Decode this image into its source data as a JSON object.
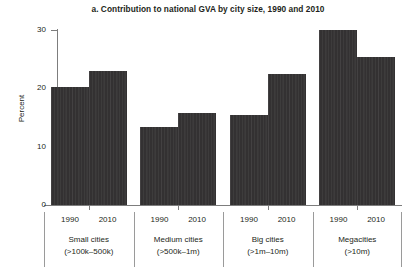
{
  "chart_data": {
    "type": "bar",
    "title": "a. Contribution to national GVA by city size, 1990 and 2010",
    "xlabel": "",
    "ylabel": "Percent",
    "ylim": [
      0,
      30
    ],
    "yticks": [
      0,
      10,
      20,
      30
    ],
    "ytick_labels": [
      "0",
      "10",
      "20",
      "30"
    ],
    "grid": false,
    "legend": "none",
    "bar_color": "#333132",
    "axis_color": "#7d7d7d",
    "categories": [
      "Small cities (>100k–500k)",
      "Medium cities (>500k–1m)",
      "Big cities (>1m–10m)",
      "Megacities (>10m)"
    ],
    "subcategories": [
      "1990",
      "2010"
    ],
    "groups": [
      {
        "name": "Small cities",
        "range": "(>100k–500k)",
        "bars": [
          {
            "year": "1990",
            "value": 20.3
          },
          {
            "year": "2010",
            "value": 23.0
          }
        ]
      },
      {
        "name": "Medium cities",
        "range": "(>500k–1m)",
        "bars": [
          {
            "year": "1990",
            "value": 13.4
          },
          {
            "year": "2010",
            "value": 15.7
          }
        ]
      },
      {
        "name": "Big cities",
        "range": "(>1m–10m)",
        "bars": [
          {
            "year": "1990",
            "value": 15.5
          },
          {
            "year": "2010",
            "value": 22.5
          }
        ]
      },
      {
        "name": "Megacities",
        "range": "(>10m)",
        "bars": [
          {
            "year": "1990",
            "value": 30.0
          },
          {
            "year": "2010",
            "value": 25.4
          }
        ]
      }
    ],
    "series": [
      {
        "name": "1990",
        "values": [
          20.3,
          13.4,
          15.5,
          30.0
        ]
      },
      {
        "name": "2010",
        "values": [
          23.0,
          15.7,
          22.5,
          25.4
        ]
      }
    ]
  }
}
